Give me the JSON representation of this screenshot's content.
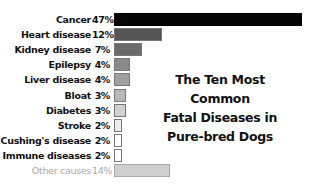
{
  "chart_data": {
    "type": "bar",
    "orientation": "horizontal",
    "title": "The Ten Most Common Fatal Diseases in Pure-bred Dogs",
    "title_lines": [
      "The Ten Most Common",
      "Fatal Diseases in",
      "Pure-bred Dogs"
    ],
    "xlabel": "",
    "ylabel": "",
    "grid": false,
    "legend": "none",
    "categories": [
      "Cancer",
      "Heart disease",
      "Kidney disease",
      "Epilepsy",
      "Liver disease",
      "Bloat",
      "Diabetes",
      "Stroke",
      "Cushing's disease",
      "Immune diseases",
      "Other causes"
    ],
    "values": [
      47,
      12,
      7,
      4,
      4,
      3,
      3,
      2,
      2,
      2,
      14
    ],
    "value_labels": [
      "47%",
      "12%",
      "7%",
      "4%",
      "4%",
      "3%",
      "3%",
      "2%",
      "2%",
      "2%",
      "14%"
    ],
    "unit": "%",
    "colors": [
      "#050505",
      "#555555",
      "#6a6a6a",
      "#8a8a8a",
      "#a0a0a0",
      "#b8b8b8",
      "#d0d0d0",
      "#ececec",
      "#ffffff",
      "#ffffff",
      "#cfcfcf"
    ],
    "muted": [
      false,
      false,
      false,
      false,
      false,
      false,
      false,
      false,
      false,
      false,
      true
    ]
  }
}
